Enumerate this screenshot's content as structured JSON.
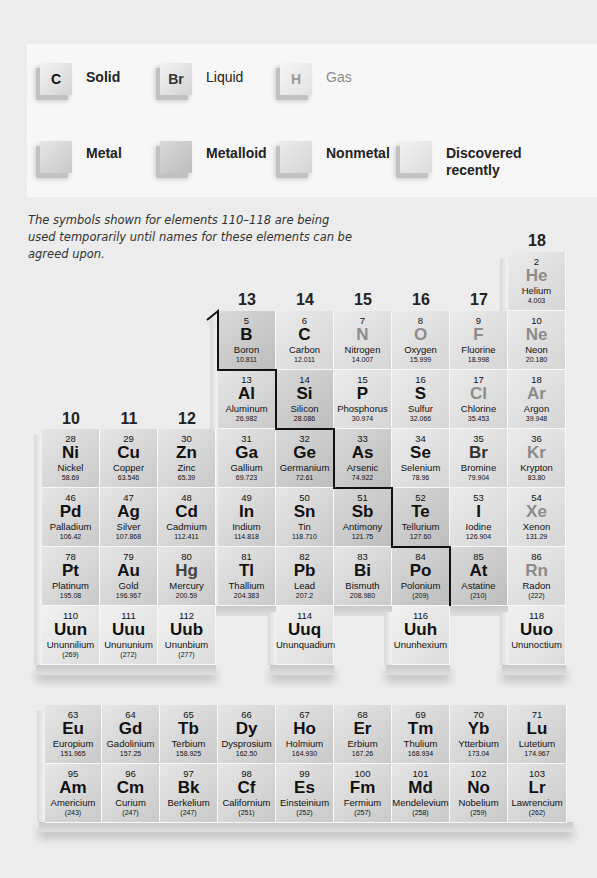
{
  "legend": {
    "states": [
      {
        "symbol": "C",
        "label": "Solid",
        "color": "#111111"
      },
      {
        "symbol": "Br",
        "label": "Liquid",
        "color": "#333333"
      },
      {
        "symbol": "H",
        "label": "Gas",
        "color": "#8c8c8c"
      }
    ],
    "categories": [
      {
        "label": "Metal"
      },
      {
        "label": "Metalloid"
      },
      {
        "label": "Nonmetal"
      },
      {
        "label": "Discovered recently"
      }
    ]
  },
  "note": "The symbols shown for elements 110–118 are being used temporarily until names for these elements can be agreed upon.",
  "group_labels": {
    "g10": "10",
    "g11": "11",
    "g12": "12",
    "g13": "13",
    "g14": "14",
    "g15": "15",
    "g16": "16",
    "g17": "17",
    "g18": "18"
  },
  "elements": {
    "He": {
      "n": "2",
      "s": "He",
      "nm": "Helium",
      "m": "4.003"
    },
    "B": {
      "n": "5",
      "s": "B",
      "nm": "Boron",
      "m": "10.811"
    },
    "C": {
      "n": "6",
      "s": "C",
      "nm": "Carbon",
      "m": "12.011"
    },
    "N": {
      "n": "7",
      "s": "N",
      "nm": "Nitrogen",
      "m": "14.007"
    },
    "O": {
      "n": "8",
      "s": "O",
      "nm": "Oxygen",
      "m": "15.999"
    },
    "F": {
      "n": "9",
      "s": "F",
      "nm": "Fluorine",
      "m": "18.998"
    },
    "Ne": {
      "n": "10",
      "s": "Ne",
      "nm": "Neon",
      "m": "20.180"
    },
    "Al": {
      "n": "13",
      "s": "Al",
      "nm": "Aluminum",
      "m": "26.982"
    },
    "Si": {
      "n": "14",
      "s": "Si",
      "nm": "Silicon",
      "m": "28.086"
    },
    "P": {
      "n": "15",
      "s": "P",
      "nm": "Phosphorus",
      "m": "30.974"
    },
    "S": {
      "n": "16",
      "s": "S",
      "nm": "Sulfur",
      "m": "32.066"
    },
    "Cl": {
      "n": "17",
      "s": "Cl",
      "nm": "Chlorine",
      "m": "35.453"
    },
    "Ar": {
      "n": "18",
      "s": "Ar",
      "nm": "Argon",
      "m": "39.948"
    },
    "Ni": {
      "n": "28",
      "s": "Ni",
      "nm": "Nickel",
      "m": "58.69"
    },
    "Cu": {
      "n": "29",
      "s": "Cu",
      "nm": "Copper",
      "m": "63.546"
    },
    "Zn": {
      "n": "30",
      "s": "Zn",
      "nm": "Zinc",
      "m": "65.39"
    },
    "Ga": {
      "n": "31",
      "s": "Ga",
      "nm": "Gallium",
      "m": "69.723"
    },
    "Ge": {
      "n": "32",
      "s": "Ge",
      "nm": "Germanium",
      "m": "72.61"
    },
    "As": {
      "n": "33",
      "s": "As",
      "nm": "Arsenic",
      "m": "74.922"
    },
    "Se": {
      "n": "34",
      "s": "Se",
      "nm": "Selenium",
      "m": "78.96"
    },
    "Br": {
      "n": "35",
      "s": "Br",
      "nm": "Bromine",
      "m": "79.904"
    },
    "Kr": {
      "n": "36",
      "s": "Kr",
      "nm": "Krypton",
      "m": "83.80"
    },
    "Pd": {
      "n": "46",
      "s": "Pd",
      "nm": "Palladium",
      "m": "106.42"
    },
    "Ag": {
      "n": "47",
      "s": "Ag",
      "nm": "Silver",
      "m": "107.868"
    },
    "Cd": {
      "n": "48",
      "s": "Cd",
      "nm": "Cadmium",
      "m": "112.411"
    },
    "In": {
      "n": "49",
      "s": "In",
      "nm": "Indium",
      "m": "114.818"
    },
    "Sn": {
      "n": "50",
      "s": "Sn",
      "nm": "Tin",
      "m": "118.710"
    },
    "Sb": {
      "n": "51",
      "s": "Sb",
      "nm": "Antimony",
      "m": "121.75"
    },
    "Te": {
      "n": "52",
      "s": "Te",
      "nm": "Tellurium",
      "m": "127.60"
    },
    "I": {
      "n": "53",
      "s": "I",
      "nm": "Iodine",
      "m": "126.904"
    },
    "Xe": {
      "n": "54",
      "s": "Xe",
      "nm": "Xenon",
      "m": "131.29"
    },
    "Pt": {
      "n": "78",
      "s": "Pt",
      "nm": "Platinum",
      "m": "195.08"
    },
    "Au": {
      "n": "79",
      "s": "Au",
      "nm": "Gold",
      "m": "196.967"
    },
    "Hg": {
      "n": "80",
      "s": "Hg",
      "nm": "Mercury",
      "m": "200.59"
    },
    "Tl": {
      "n": "81",
      "s": "Tl",
      "nm": "Thallium",
      "m": "204.383"
    },
    "Pb": {
      "n": "82",
      "s": "Pb",
      "nm": "Lead",
      "m": "207.2"
    },
    "Bi": {
      "n": "83",
      "s": "Bi",
      "nm": "Bismuth",
      "m": "208.980"
    },
    "Po": {
      "n": "84",
      "s": "Po",
      "nm": "Polonium",
      "m": "(209)"
    },
    "At": {
      "n": "85",
      "s": "At",
      "nm": "Astatine",
      "m": "(210)"
    },
    "Rn": {
      "n": "86",
      "s": "Rn",
      "nm": "Radon",
      "m": "(222)"
    },
    "Uun": {
      "n": "110",
      "s": "Uun",
      "nm": "Ununnilium",
      "m": "(269)"
    },
    "Uuu": {
      "n": "111",
      "s": "Uuu",
      "nm": "Unununium",
      "m": "(272)"
    },
    "Uub": {
      "n": "112",
      "s": "Uub",
      "nm": "Ununbium",
      "m": "(277)"
    },
    "Uuq": {
      "n": "114",
      "s": "Uuq",
      "nm": "Ununquadium",
      "m": ""
    },
    "Uuh": {
      "n": "116",
      "s": "Uuh",
      "nm": "Ununhexium",
      "m": ""
    },
    "Uuo": {
      "n": "118",
      "s": "Uuo",
      "nm": "Ununoctium",
      "m": ""
    },
    "Eu": {
      "n": "63",
      "s": "Eu",
      "nm": "Europium",
      "m": "151.965"
    },
    "Gd": {
      "n": "64",
      "s": "Gd",
      "nm": "Gadolinium",
      "m": "157.25"
    },
    "Tb": {
      "n": "65",
      "s": "Tb",
      "nm": "Terbium",
      "m": "158.925"
    },
    "Dy": {
      "n": "66",
      "s": "Dy",
      "nm": "Dysprosium",
      "m": "162.50"
    },
    "Ho": {
      "n": "67",
      "s": "Ho",
      "nm": "Holmium",
      "m": "164.930"
    },
    "Er": {
      "n": "68",
      "s": "Er",
      "nm": "Erbium",
      "m": "167.26"
    },
    "Tm": {
      "n": "69",
      "s": "Tm",
      "nm": "Thulium",
      "m": "168.934"
    },
    "Yb": {
      "n": "70",
      "s": "Yb",
      "nm": "Ytterbium",
      "m": "173.04"
    },
    "Lu": {
      "n": "71",
      "s": "Lu",
      "nm": "Lutetium",
      "m": "174.967"
    },
    "Am": {
      "n": "95",
      "s": "Am",
      "nm": "Americium",
      "m": "(243)"
    },
    "Cm": {
      "n": "96",
      "s": "Cm",
      "nm": "Curium",
      "m": "(247)"
    },
    "Bk": {
      "n": "97",
      "s": "Bk",
      "nm": "Berkelium",
      "m": "(247)"
    },
    "Cf": {
      "n": "98",
      "s": "Cf",
      "nm": "Californium",
      "m": "(251)"
    },
    "Es": {
      "n": "99",
      "s": "Es",
      "nm": "Einsteinium",
      "m": "(252)"
    },
    "Fm": {
      "n": "100",
      "s": "Fm",
      "nm": "Fermium",
      "m": "(257)"
    },
    "Md": {
      "n": "101",
      "s": "Md",
      "nm": "Mendelevium",
      "m": "(258)"
    },
    "No": {
      "n": "102",
      "s": "No",
      "nm": "Nobelium",
      "m": "(259)"
    },
    "Lr": {
      "n": "103",
      "s": "Lr",
      "nm": "Lawrencium",
      "m": "(262)"
    }
  }
}
